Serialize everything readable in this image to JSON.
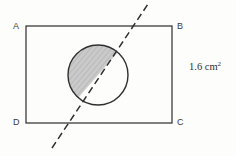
{
  "figure": {
    "background_color": "#fdfdfc",
    "stroke_color": "#3c3c3c",
    "shade_fill_color": "#c9c9c9",
    "hatch_color": "#9a9a9a",
    "labels": {
      "top_left": "A",
      "top_right": "B",
      "bottom_right": "C",
      "bottom_left": "D"
    },
    "annotation": {
      "value": "1.6",
      "unit": "cm",
      "exponent": "2",
      "full_text": "1.6 cm²"
    },
    "rectangle": {
      "x": 26,
      "y": 26,
      "width": 146,
      "height": 97
    },
    "circle": {
      "cx": 98,
      "cy": 75,
      "r": 30
    },
    "dashed_line": {
      "x1": 52,
      "y1": 148,
      "x2": 148,
      "y2": 4,
      "dash_length": 7,
      "gap_length": 4
    },
    "chord": {
      "entry_x": 118,
      "entry_y": 52,
      "exit_x": 78,
      "exit_y": 98
    }
  }
}
